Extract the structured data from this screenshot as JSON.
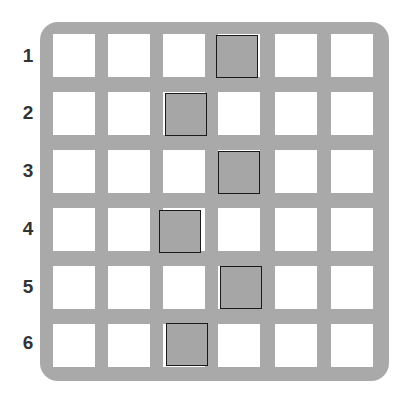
{
  "grid": {
    "rows": 6,
    "cols": 6,
    "row_labels": [
      "1",
      "2",
      "3",
      "4",
      "5",
      "6"
    ],
    "colors": {
      "board": "#a9a9a9",
      "cell": "#ffffff",
      "marked": "#a6a6a6",
      "marked_border": "#1a1a1a"
    },
    "marked": [
      {
        "row": 1,
        "x": 216,
        "y": 35
      },
      {
        "row": 2,
        "x": 165,
        "y": 93
      },
      {
        "row": 3,
        "x": 218,
        "y": 151
      },
      {
        "row": 4,
        "x": 159,
        "y": 210
      },
      {
        "row": 5,
        "x": 220,
        "y": 266
      },
      {
        "row": 6,
        "x": 166,
        "y": 323
      }
    ]
  }
}
